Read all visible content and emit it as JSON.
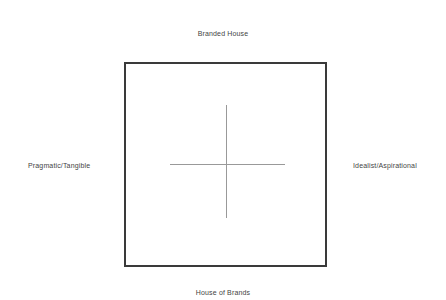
{
  "diagram": {
    "axes": {
      "top_label": "Branded House",
      "bottom_label": "House of Brands",
      "left_label": "Pragmatic/Tangible",
      "right_label": "Idealist/Aspirational"
    },
    "colors": {
      "background": "#ffffff",
      "square_border": "#3a3a3a",
      "axis_line": "#999999",
      "label_text": "#444444"
    }
  }
}
